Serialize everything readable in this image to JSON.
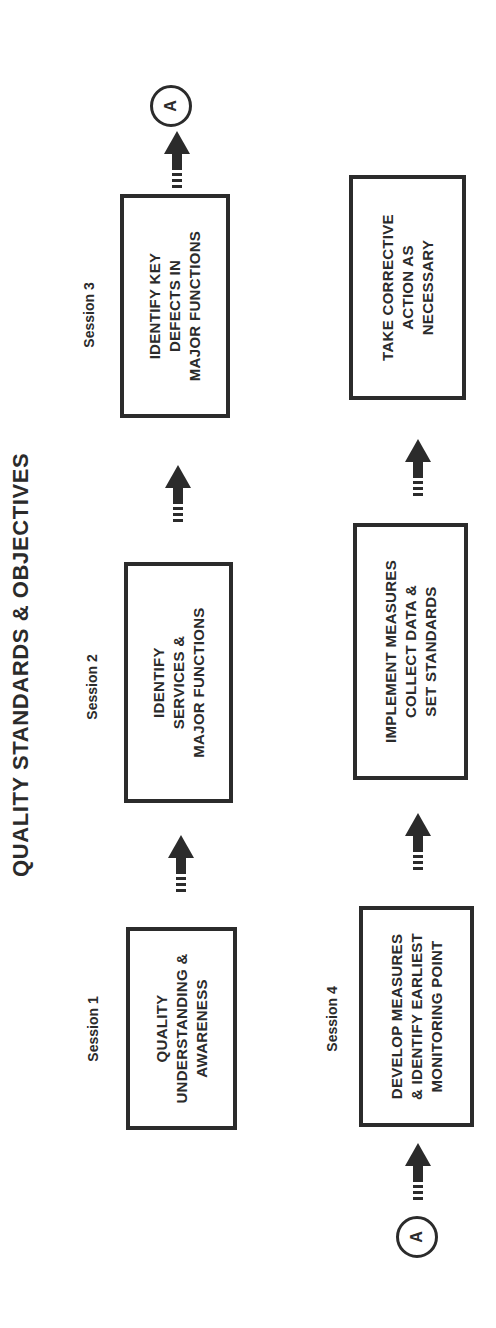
{
  "diagram": {
    "title": "QUALITY STANDARDS & OBJECTIVES",
    "orientation": "rotated 90 degrees counter-clockwise",
    "ink_color": "#2b2b2b",
    "background_color": "#ffffff",
    "sessions": [
      {
        "label": "Session 1"
      },
      {
        "label": "Session 2"
      },
      {
        "label": "Session 3"
      },
      {
        "label": "Session 4"
      }
    ],
    "steps": [
      {
        "id": "step-1",
        "session": "Session 1",
        "lines": [
          "QUALITY",
          "UNDERSTANDING &",
          "AWARENESS"
        ]
      },
      {
        "id": "step-2",
        "session": "Session 2",
        "lines": [
          "IDENTIFY",
          "SERVICES &",
          "MAJOR FUNCTIONS"
        ]
      },
      {
        "id": "step-3",
        "session": "Session 3",
        "lines": [
          "IDENTIFY KEY",
          "DEFECTS IN",
          "MAJOR FUNCTIONS"
        ]
      },
      {
        "id": "step-4",
        "session": "Session 4",
        "lines": [
          "DEVELOP MEASURES",
          "& IDENTIFY EARLIEST",
          "MONITORING POINT"
        ]
      },
      {
        "id": "step-5",
        "session": "",
        "lines": [
          "IMPLEMENT MEASURES",
          "COLLECT DATA &",
          "SET STANDARDS"
        ]
      },
      {
        "id": "step-6",
        "session": "",
        "lines": [
          "TAKE CORRECTIVE",
          "ACTION AS",
          "NECESSARY"
        ]
      }
    ],
    "connectors": {
      "top_row_end": "A",
      "bottom_row_start": "A"
    },
    "flow": [
      [
        "step-1",
        "step-2"
      ],
      [
        "step-2",
        "step-3"
      ],
      [
        "step-3",
        "connector-A"
      ],
      [
        "connector-A",
        "step-4"
      ],
      [
        "step-4",
        "step-5"
      ],
      [
        "step-5",
        "step-6"
      ]
    ]
  }
}
